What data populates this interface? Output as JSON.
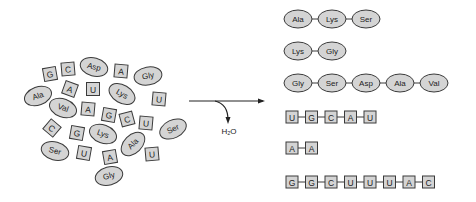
{
  "colors": {
    "fill": "#d4d4d4",
    "stroke": "#3a3a3a",
    "text": "#222222",
    "background": "#ffffff"
  },
  "reaction": {
    "byproduct_label": "H2O",
    "byproduct_display": "H₂O",
    "direction": "left-to-right"
  },
  "monomer_pool": {
    "amino_acids": [
      {
        "label": "Asp",
        "x": 94,
        "y": 67,
        "rot": 15
      },
      {
        "label": "Gly",
        "x": 148,
        "y": 76,
        "rot": -10
      },
      {
        "label": "Ala",
        "x": 38,
        "y": 96,
        "rot": -20
      },
      {
        "label": "Lys",
        "x": 122,
        "y": 94,
        "rot": 30
      },
      {
        "label": "Val",
        "x": 63,
        "y": 108,
        "rot": 20
      },
      {
        "label": "Ser",
        "x": 173,
        "y": 129,
        "rot": -25
      },
      {
        "label": "Lys",
        "x": 103,
        "y": 134,
        "rot": 20
      },
      {
        "label": "Ser",
        "x": 55,
        "y": 151,
        "rot": 15
      },
      {
        "label": "Ala",
        "x": 133,
        "y": 144,
        "rot": -45
      },
      {
        "label": "Gly",
        "x": 109,
        "y": 176,
        "rot": -15
      }
    ],
    "nucleotides": [
      {
        "label": "G",
        "x": 50,
        "y": 74,
        "rot": -10
      },
      {
        "label": "C",
        "x": 68,
        "y": 69,
        "rot": -5
      },
      {
        "label": "A",
        "x": 121,
        "y": 71,
        "rot": 5
      },
      {
        "label": "A",
        "x": 70,
        "y": 89,
        "rot": 20
      },
      {
        "label": "U",
        "x": 93,
        "y": 89,
        "rot": 0
      },
      {
        "label": "U",
        "x": 159,
        "y": 99,
        "rot": 5
      },
      {
        "label": "A",
        "x": 88,
        "y": 109,
        "rot": 5
      },
      {
        "label": "G",
        "x": 109,
        "y": 115,
        "rot": 10
      },
      {
        "label": "C",
        "x": 127,
        "y": 119,
        "rot": -15
      },
      {
        "label": "U",
        "x": 146,
        "y": 123,
        "rot": 5
      },
      {
        "label": "C",
        "x": 52,
        "y": 128,
        "rot": 40
      },
      {
        "label": "G",
        "x": 77,
        "y": 133,
        "rot": 10
      },
      {
        "label": "U",
        "x": 84,
        "y": 153,
        "rot": 10
      },
      {
        "label": "A",
        "x": 110,
        "y": 157,
        "rot": -10
      },
      {
        "label": "U",
        "x": 152,
        "y": 154,
        "rot": -5
      }
    ]
  },
  "polymers": {
    "peptides": [
      {
        "name": "peptide-1",
        "y": 19,
        "residues": [
          "Ala",
          "Lys",
          "Ser"
        ]
      },
      {
        "name": "peptide-2",
        "y": 51,
        "residues": [
          "Lys",
          "Gly"
        ]
      },
      {
        "name": "peptide-3",
        "y": 83,
        "residues": [
          "Gly",
          "Ser",
          "Asp",
          "Ala",
          "Val"
        ]
      }
    ],
    "nucleic_acids": [
      {
        "name": "rna-1",
        "y": 117,
        "bases": [
          "U",
          "G",
          "C",
          "A",
          "U"
        ]
      },
      {
        "name": "rna-2",
        "y": 148,
        "bases": [
          "A",
          "A"
        ]
      },
      {
        "name": "rna-3",
        "y": 182,
        "bases": [
          "G",
          "G",
          "C",
          "U",
          "U",
          "U",
          "A",
          "C"
        ]
      }
    ]
  }
}
